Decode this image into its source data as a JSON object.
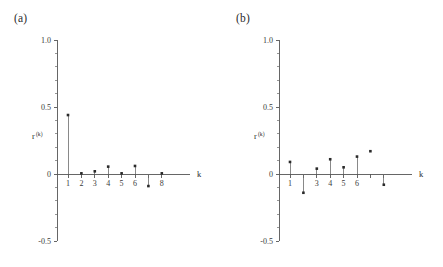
{
  "figure": {
    "background_color": "#ffffff",
    "axis_color": "#555555",
    "stem_color": "#6b6b6b",
    "marker_color": "#2a2a2a",
    "width": 443,
    "height": 267
  },
  "panels": [
    {
      "id": "a",
      "label": "(a)",
      "ylabel_base": "r",
      "ylabel_sup": "(k)",
      "xlabel": "k",
      "y_ticks": [
        "1.0",
        "0.5",
        "0",
        "-0.5"
      ],
      "x_ticks": [
        "1",
        "2",
        "3",
        "4",
        "5",
        "6",
        "8"
      ]
    },
    {
      "id": "b",
      "label": "(b)",
      "ylabel_base": "r",
      "ylabel_sup": "(k)",
      "xlabel": "k",
      "y_ticks": [
        "1.0",
        "0.5",
        "0",
        "-0.5"
      ],
      "x_ticks": [
        "1",
        "3",
        "4",
        "5",
        "6"
      ]
    }
  ],
  "chart_data": [
    {
      "type": "scatter",
      "subtype": "stem",
      "panel": "a",
      "title": "(a)",
      "xlabel": "k",
      "ylabel": "r^(k)",
      "x": [
        1,
        2,
        3,
        4,
        5,
        6,
        7,
        8
      ],
      "values": [
        0.44,
        0.005,
        0.02,
        0.055,
        0.005,
        0.06,
        -0.09,
        0.005
      ],
      "xlim": [
        0.3,
        8.7
      ],
      "ylim": [
        -0.5,
        1.0
      ],
      "y_tick_values": [
        1.0,
        0.5,
        0.0,
        -0.5
      ],
      "y_tick_labels": [
        "1.0",
        "0.5",
        "0",
        "-0.5"
      ],
      "y_minor_tick_interval": 0.1,
      "x_tick_values": [
        1,
        2,
        3,
        4,
        5,
        6,
        7,
        8
      ],
      "x_tick_labels": [
        "1",
        "2",
        "3",
        "4",
        "5",
        "6",
        "",
        "8"
      ],
      "grid": false,
      "legend": false
    },
    {
      "type": "scatter",
      "subtype": "stem",
      "panel": "b",
      "title": "(b)",
      "xlabel": "k",
      "ylabel": "r^(k)",
      "x": [
        1,
        2,
        3,
        4,
        5,
        6,
        7,
        8
      ],
      "values": [
        0.09,
        -0.14,
        0.04,
        0.11,
        0.05,
        0.13,
        0.17,
        -0.08
      ],
      "xlim": [
        0.3,
        8.7
      ],
      "ylim": [
        -0.5,
        1.0
      ],
      "y_tick_values": [
        1.0,
        0.5,
        0.0,
        -0.5
      ],
      "y_tick_labels": [
        "1.0",
        "0.5",
        "0",
        "-0.5"
      ],
      "y_minor_tick_interval": 0.1,
      "x_tick_values": [
        1,
        2,
        3,
        4,
        5,
        6,
        7,
        8
      ],
      "x_tick_labels": [
        "1",
        "",
        "3",
        "4",
        "5",
        "6",
        "",
        ""
      ],
      "grid": false,
      "legend": false,
      "notes": "marker at k=7 drawn detached from the baseline"
    }
  ]
}
